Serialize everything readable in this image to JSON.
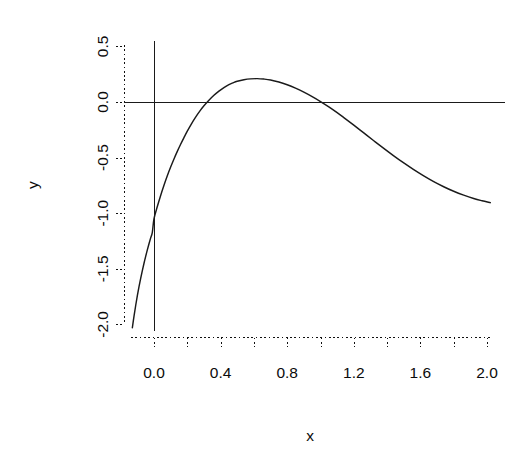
{
  "chart_data": {
    "type": "line",
    "title": "",
    "xlabel": "x",
    "ylabel": "y",
    "xlim": [
      -0.14,
      2.05
    ],
    "ylim": [
      -2.06,
      0.58
    ],
    "grid": false,
    "legend": null,
    "x_ticks": [
      0.0,
      0.2,
      0.4,
      0.6,
      0.8,
      1.0,
      1.2,
      1.4,
      1.6,
      1.8,
      2.0
    ],
    "x_tick_labels": [
      "0.0",
      "",
      "0.4",
      "",
      "0.8",
      "",
      "1.2",
      "",
      "1.6",
      "",
      "2.0"
    ],
    "x_labeled_ticks": [
      "0.0",
      "0.4",
      "0.8",
      "1.2",
      "1.6",
      "2.0"
    ],
    "y_ticks": [
      -2.0,
      -1.5,
      -1.0,
      -0.5,
      0.0,
      0.5
    ],
    "y_tick_labels": [
      "-2.0",
      "-1.5",
      "-1.0",
      "-0.5",
      "0.0",
      "0.5"
    ],
    "annotations": [
      {
        "name": "horizontal-reference-line",
        "kind": "hline",
        "y": 0.0
      },
      {
        "name": "vertical-reference-line",
        "kind": "vline",
        "x": 0.0,
        "y_from": -2.06,
        "y_to": 0.55
      }
    ],
    "series": [
      {
        "name": "curve",
        "color": "#1a1a1a",
        "x": [
          -0.13,
          -0.12,
          -0.11,
          -0.1,
          -0.09,
          -0.08,
          -0.07,
          -0.06,
          -0.05,
          -0.04,
          -0.03,
          -0.02,
          -0.01,
          0.0,
          0.02,
          0.04,
          0.06,
          0.08,
          0.1,
          0.12,
          0.14,
          0.16,
          0.18,
          0.2,
          0.225,
          0.25,
          0.275,
          0.3,
          0.33,
          0.36,
          0.39,
          0.42,
          0.45,
          0.474,
          0.5,
          0.54,
          0.58,
          0.62,
          0.66,
          0.7,
          0.75,
          0.8,
          0.85,
          0.9,
          0.95,
          1.0,
          1.05,
          1.1,
          1.14,
          1.2,
          1.26,
          1.32,
          1.38,
          1.44,
          1.5,
          1.56,
          1.62,
          1.68,
          1.74,
          1.8,
          1.86,
          1.92,
          1.97,
          2.02
        ],
        "y": [
          -2.03,
          -1.925,
          -1.83,
          -1.742,
          -1.661,
          -1.586,
          -1.516,
          -1.45,
          -1.388,
          -1.33,
          -1.275,
          -1.222,
          -1.172,
          -1.05,
          -0.94,
          -0.84,
          -0.748,
          -0.663,
          -0.585,
          -0.512,
          -0.444,
          -0.38,
          -0.32,
          -0.262,
          -0.196,
          -0.136,
          -0.082,
          -0.034,
          0.016,
          0.06,
          0.098,
          0.13,
          0.156,
          0.172,
          0.186,
          0.2,
          0.208,
          0.21,
          0.206,
          0.198,
          0.18,
          0.155,
          0.124,
          0.088,
          0.048,
          0.004,
          -0.044,
          -0.096,
          -0.14,
          -0.208,
          -0.278,
          -0.348,
          -0.417,
          -0.484,
          -0.548,
          -0.608,
          -0.664,
          -0.716,
          -0.762,
          -0.803,
          -0.838,
          -0.868,
          -0.888,
          -0.905
        ]
      }
    ]
  },
  "axis_titles": {
    "x": "x",
    "y": "y"
  },
  "icons": {
    "plot_area": "line-chart-icon"
  }
}
